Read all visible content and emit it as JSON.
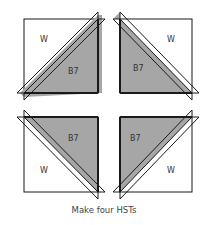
{
  "diagram": {
    "blocks": [
      {
        "position": "top-left",
        "white_label": "W",
        "fabric_label": "B7"
      },
      {
        "position": "top-right",
        "white_label": "W",
        "fabric_label": "B7"
      },
      {
        "position": "bottom-left",
        "white_label": "W",
        "fabric_label": "B7"
      },
      {
        "position": "bottom-right",
        "white_label": "W",
        "fabric_label": "B7"
      }
    ],
    "colors": {
      "fabric": "#a6a6a6",
      "white": "#ffffff",
      "stroke": "#1a1a1a"
    },
    "caption": "Make four HSTs"
  }
}
